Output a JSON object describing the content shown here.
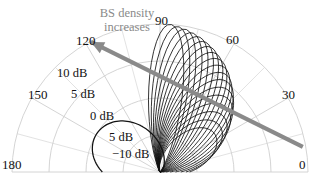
{
  "chart_data": {
    "type": "line",
    "title": "",
    "subtitle": "",
    "projection": "polar-half",
    "xlabel": "",
    "ylabel": "",
    "grid": true,
    "legend_position": "none",
    "angular_axis": {
      "unit": "degrees",
      "range": [
        0,
        180
      ],
      "tick_step": 30,
      "tick_labels": [
        "0",
        "30",
        "60",
        "90",
        "120",
        "150",
        "180"
      ]
    },
    "radial_axis": {
      "unit": "dB",
      "range": [
        -10,
        10
      ],
      "tick_step": 5,
      "tick_labels": [
        "-10 dB",
        "5 dB",
        "0 dB",
        "5 dB",
        "10 dB"
      ],
      "tick_values": [
        -10,
        -5,
        0,
        5,
        10
      ]
    },
    "annotations": [
      {
        "text_line_1": "BS density",
        "text_line_2": "increases",
        "type": "arrow",
        "color": "#8a8a8a",
        "from_deg": 10,
        "to_deg": 118,
        "direction": "toward higher angles / larger lobes"
      }
    ],
    "series": [
      {
        "name": "pattern 1",
        "beam_peak_deg": 35,
        "peak_db": -1.0,
        "lobe_width_deg": 110
      },
      {
        "name": "pattern 2",
        "beam_peak_deg": 38,
        "peak_db": 0.2,
        "lobe_width_deg": 104
      },
      {
        "name": "pattern 3",
        "beam_peak_deg": 41,
        "peak_db": 1.4,
        "lobe_width_deg": 98
      },
      {
        "name": "pattern 4",
        "beam_peak_deg": 44,
        "peak_db": 2.5,
        "lobe_width_deg": 93
      },
      {
        "name": "pattern 5",
        "beam_peak_deg": 47,
        "peak_db": 3.5,
        "lobe_width_deg": 88
      },
      {
        "name": "pattern 6",
        "beam_peak_deg": 50,
        "peak_db": 4.4,
        "lobe_width_deg": 83
      },
      {
        "name": "pattern 7",
        "beam_peak_deg": 53,
        "peak_db": 5.2,
        "lobe_width_deg": 79
      },
      {
        "name": "pattern 8",
        "beam_peak_deg": 56,
        "peak_db": 5.9,
        "lobe_width_deg": 75
      },
      {
        "name": "pattern 9",
        "beam_peak_deg": 59,
        "peak_db": 6.6,
        "lobe_width_deg": 71
      },
      {
        "name": "pattern 10",
        "beam_peak_deg": 62,
        "peak_db": 7.2,
        "lobe_width_deg": 67
      },
      {
        "name": "pattern 11",
        "beam_peak_deg": 65,
        "peak_db": 7.7,
        "lobe_width_deg": 63
      },
      {
        "name": "pattern 12",
        "beam_peak_deg": 68,
        "peak_db": 8.2,
        "lobe_width_deg": 60
      },
      {
        "name": "pattern 13",
        "beam_peak_deg": 71,
        "peak_db": 8.6,
        "lobe_width_deg": 57
      },
      {
        "name": "pattern 14",
        "beam_peak_deg": 74,
        "peak_db": 9.0,
        "lobe_width_deg": 54
      },
      {
        "name": "pattern 15",
        "beam_peak_deg": 77,
        "peak_db": 9.3,
        "lobe_width_deg": 51
      },
      {
        "name": "pattern 16",
        "beam_peak_deg": 80,
        "peak_db": 9.6,
        "lobe_width_deg": 48
      },
      {
        "name": "pattern 17",
        "beam_peak_deg": 83,
        "peak_db": 9.8,
        "lobe_width_deg": 46
      },
      {
        "name": "pattern 18",
        "beam_peak_deg": 86,
        "peak_db": 10.0,
        "lobe_width_deg": 44
      },
      {
        "name": "baseline omni back lobe",
        "beam_peak_deg": 150,
        "peak_db": 0.0,
        "lobe_width_deg": 170
      }
    ],
    "colors": {
      "curve": "#111111",
      "grid": "#cfcfcf",
      "axis_text": "#111111",
      "annotation": "#8a8a8a",
      "background": "#ffffff"
    }
  },
  "angular_labels": [
    {
      "name": "0",
      "text": "0"
    },
    {
      "name": "30",
      "text": "30"
    },
    {
      "name": "60",
      "text": "60"
    },
    {
      "name": "90",
      "text": "90"
    },
    {
      "name": "120",
      "text": "120"
    },
    {
      "name": "150",
      "text": "150"
    },
    {
      "name": "180",
      "text": "180"
    }
  ],
  "radial_labels": [
    {
      "name": "r10",
      "text": "10 dB"
    },
    {
      "name": "r5",
      "text": "5 dB"
    },
    {
      "name": "r0",
      "text": "0 dB"
    },
    {
      "name": "rm5",
      "text": "5 dB"
    },
    {
      "name": "rm10",
      "text": "−10 dB"
    }
  ],
  "annotation": {
    "line1": "BS density",
    "line2": "increases"
  }
}
